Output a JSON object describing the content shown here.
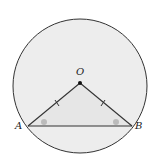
{
  "diagram": {
    "type": "circle-geometry",
    "circle": {
      "cx": 80,
      "cy": 86,
      "r": 67,
      "fill": "#ededed",
      "stroke": "#333333"
    },
    "points": {
      "O": {
        "label": "O",
        "x": 80,
        "y": 83
      },
      "A": {
        "label": "A",
        "x": 28,
        "y": 126
      },
      "B": {
        "label": "B",
        "x": 132,
        "y": 126
      }
    },
    "segments": [
      "OA",
      "OB",
      "AB"
    ],
    "tick_marks": [
      "OA",
      "OB"
    ],
    "angle_markers": [
      "A",
      "B"
    ],
    "angle_marker_color": "#bbbbbb"
  }
}
